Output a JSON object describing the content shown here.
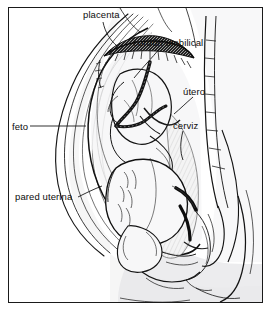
{
  "figure": {
    "language": "es",
    "border_color": "#1a1a1a",
    "background_color": "#ffffff",
    "ink_color": "#101010",
    "shade_color": "#e9e9ea",
    "placenta_color": "#1c1c1c"
  },
  "labels": {
    "placenta": "placenta",
    "cordon_umbilical": "cordón umbilical",
    "utero": "útero",
    "cerviz": "cerviz",
    "feto": "feto",
    "pared_uterina": "pared uterina"
  }
}
